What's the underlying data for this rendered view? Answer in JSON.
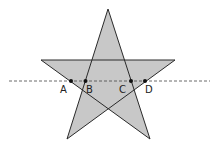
{
  "diagram": {
    "type": "pentagram-with-line",
    "colors": {
      "fill": "#c8c8c8",
      "stroke": "#2a2a2a",
      "dash": "#444444",
      "point": "#111111"
    },
    "star": {
      "vertices": [
        {
          "name": "top",
          "x": 108,
          "y": 9
        },
        {
          "name": "bottom-right",
          "x": 150,
          "y": 139
        },
        {
          "name": "left",
          "x": 41,
          "y": 60
        },
        {
          "name": "right",
          "x": 175,
          "y": 60
        },
        {
          "name": "bottom-left",
          "x": 67,
          "y": 139
        }
      ]
    },
    "line": {
      "y": 81,
      "x1": 9,
      "x2": 210
    },
    "points": [
      {
        "label": "A",
        "x": 71,
        "y": 81,
        "lx": 60,
        "ly": 93
      },
      {
        "label": "B",
        "x": 85.5,
        "y": 81,
        "lx": 86,
        "ly": 93
      },
      {
        "label": "C",
        "x": 131,
        "y": 81,
        "lx": 119,
        "ly": 93
      },
      {
        "label": "D",
        "x": 145,
        "y": 81,
        "lx": 145,
        "ly": 93
      }
    ]
  }
}
